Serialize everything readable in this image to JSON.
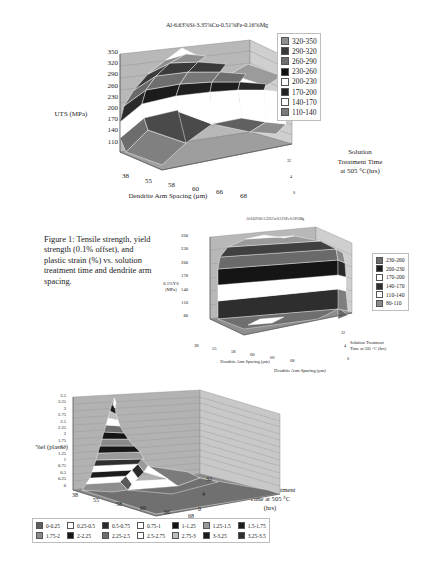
{
  "figure": {
    "caption": "Figure 1: Tensile strength, yield strength (0.1% offset), and plastic strain (%) vs. solution treatment time and dendrite arm spacing."
  },
  "charts": [
    {
      "id": "uts",
      "type": "surface3d",
      "title": "Al-6.63%Si-3.35%Cu-0.51%Fe-0.16%Mg",
      "zlabel": "UTS (MPa)",
      "xlabel": "Dendrite Arm Spacing (µm)",
      "ylabel_lines": [
        "Solution",
        "Treatment Time",
        "at 505 °C(hrs)"
      ],
      "x_categories": [
        "38",
        "55",
        "58",
        "60",
        "66",
        "68"
      ],
      "y_categories": [
        "0",
        "4",
        "32"
      ],
      "z_ticks": [
        "350",
        "320",
        "290",
        "260",
        "230",
        "200",
        "170",
        "140",
        "110"
      ],
      "zlim": [
        110,
        350
      ],
      "legend": [
        {
          "label": "320-350",
          "color": "#8f8f8f"
        },
        {
          "label": "290-320",
          "color": "#3a3a3a"
        },
        {
          "label": "260-290",
          "color": "#6e6e6e"
        },
        {
          "label": "230-260",
          "color": "#111111"
        },
        {
          "label": "200-230",
          "color": "#ffffff"
        },
        {
          "label": "170-200",
          "color": "#222222"
        },
        {
          "label": "140-170",
          "color": "#ffffff"
        },
        {
          "label": "110-140",
          "color": "#7a7a7a"
        }
      ],
      "surface": [
        [
          232,
          250,
          268,
          243,
          215,
          196
        ],
        [
          300,
          318,
          286,
          252,
          222,
          205
        ],
        [
          333,
          347,
          300,
          262,
          233,
          214
        ]
      ]
    },
    {
      "id": "ys",
      "type": "surface3d",
      "title": "Al-6.63%Si-3.35%Cu-0.51%Fe-0.16%Mg",
      "zlabel_lines": [
        "0.1%YS",
        "(MPa)"
      ],
      "xlabel": "Dendrite Arm Spacing (µm)",
      "ylabel_lines": [
        "Solution Treatment",
        "Time at 505 °C  (hrs)"
      ],
      "x_categories": [
        "38",
        "55",
        "58",
        "60",
        "66",
        "68"
      ],
      "y_categories": [
        "0",
        "4",
        "32"
      ],
      "z_ticks": [
        "260",
        "230",
        "200",
        "170",
        "140",
        "110",
        "80"
      ],
      "zlim": [
        80,
        260
      ],
      "legend": [
        {
          "label": "230-260",
          "color": "#6e6e6e"
        },
        {
          "label": "200-230",
          "color": "#1c1c1c"
        },
        {
          "label": "170-200",
          "color": "#ffffff"
        },
        {
          "label": "140-170",
          "color": "#303030"
        },
        {
          "label": "110-140",
          "color": "#ffffff"
        },
        {
          "label": "80-110",
          "color": "#8a8a8a"
        }
      ],
      "surface": [
        [
          150,
          168,
          162,
          152,
          142,
          135
        ],
        [
          215,
          232,
          228,
          220,
          212,
          196
        ],
        [
          248,
          258,
          250,
          244,
          238,
          212
        ]
      ]
    },
    {
      "id": "elongation",
      "type": "surface3d",
      "zlabel": "%el (plastic)",
      "xlabel": "Dendrite Arm Spacing (µm)",
      "ylabel_lines": [
        "Solution Treatment",
        "Time at 505 °C",
        "(hrs)"
      ],
      "x_categories": [
        "38",
        "55",
        "58",
        "60",
        "66",
        "68"
      ],
      "y_categories": [
        "0",
        "4",
        "32"
      ],
      "z_ticks": [
        "3.5",
        "3.25",
        "3",
        "2.75",
        "2.5",
        "2.25",
        "2",
        "1.75",
        "1.5",
        "1.25",
        "1",
        "0.75",
        "0.5",
        "0.25",
        "0"
      ],
      "zlim": [
        0,
        3.5
      ],
      "legend": [
        {
          "label": "0-0.25",
          "color": "#5e5e5e"
        },
        {
          "label": "0.25-0.5",
          "color": "#ffffff"
        },
        {
          "label": "0.5-0.75",
          "color": "#2a2a2a"
        },
        {
          "label": "0.75-1",
          "color": "#ffffff"
        },
        {
          "label": "1-1.25",
          "color": "#111111"
        },
        {
          "label": "1.25-1.5",
          "color": "#9a9a9a"
        },
        {
          "label": "1.5-1.75",
          "color": "#1c1c1c"
        },
        {
          "label": "1.75-2",
          "color": "#8a8a8a"
        },
        {
          "label": "2-2.25",
          "color": "#141414"
        },
        {
          "label": "2.25-2.5",
          "color": "#6e6e6e"
        },
        {
          "label": "2.5-2.75",
          "color": "#ffffff"
        },
        {
          "label": "2.75-3",
          "color": "#bdbdbd"
        },
        {
          "label": "3-3.25",
          "color": "#1a1a1a"
        },
        {
          "label": "3.25-3.5",
          "color": "#2e2e2e"
        }
      ],
      "surface": [
        [
          0.55,
          0.35,
          0.28,
          0.22,
          0.18,
          0.15
        ],
        [
          1.55,
          0.95,
          0.72,
          0.55,
          0.38,
          0.3
        ],
        [
          3.45,
          1.55,
          1.05,
          0.82,
          0.52,
          0.35
        ]
      ]
    }
  ]
}
